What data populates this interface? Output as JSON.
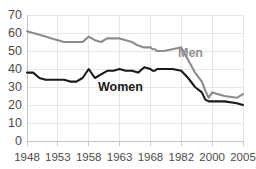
{
  "chart_data": {
    "type": "line",
    "title": "",
    "xlabel": "",
    "ylabel": "",
    "ylim": [
      0,
      70
    ],
    "grid": true,
    "legend_position": "inline-labels",
    "yticks": [
      0,
      10,
      20,
      30,
      40,
      50,
      60,
      70
    ],
    "ytick_labels": [
      "0",
      "10",
      "20",
      "30",
      "40",
      "50",
      "60",
      "70"
    ],
    "xtick_labels": [
      "1948",
      "1953",
      "1958",
      "1963",
      "1968",
      "1982",
      "2000",
      "2005"
    ],
    "x": [
      1948,
      1949,
      1950,
      1951,
      1952,
      1953,
      1954,
      1955,
      1956,
      1957,
      1958,
      1959,
      1960,
      1961,
      1962,
      1963,
      1964,
      1965,
      1966,
      1967,
      1968,
      1969,
      1970,
      1971,
      1974,
      1978,
      1982,
      1986,
      1990,
      1994,
      1996,
      1998,
      2000,
      2002,
      2004,
      2005
    ],
    "series": [
      {
        "name": "Men",
        "color": "#8c8c8c",
        "label_text": "Men",
        "values": [
          61,
          60,
          59,
          58,
          57,
          56,
          55,
          55,
          55,
          55,
          58,
          56,
          55,
          57,
          57,
          57,
          56,
          55,
          53,
          52,
          52,
          51,
          51,
          50,
          50,
          51,
          52,
          45,
          38,
          33,
          28,
          24,
          27,
          25,
          24,
          26
        ]
      },
      {
        "name": "Women",
        "color": "#1a1a1a",
        "label_text": "Women",
        "values": [
          38,
          38,
          35,
          34,
          34,
          34,
          34,
          33,
          33,
          35,
          40,
          35,
          37,
          39,
          39,
          40,
          39,
          39,
          38,
          41,
          40,
          39,
          39,
          40,
          40,
          40,
          39,
          35,
          30,
          27,
          23,
          22,
          22,
          22,
          21,
          20
        ]
      }
    ]
  }
}
